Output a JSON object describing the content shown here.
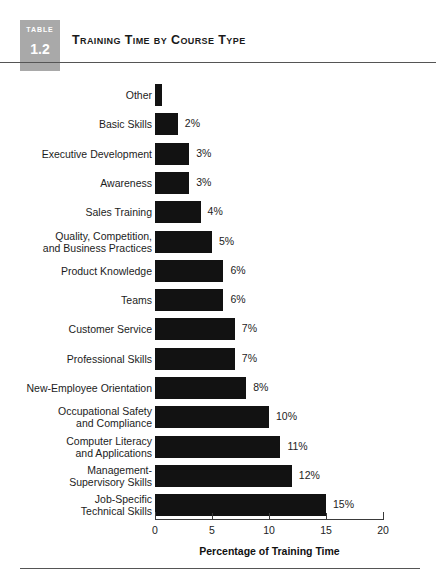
{
  "header": {
    "badge_word": "TABLE",
    "badge_number": "1.2",
    "title": "Training Time by Course Type",
    "badge_color": "#a9a9a9"
  },
  "chart_data": {
    "type": "bar",
    "orientation": "horizontal",
    "title": "Training Time by Course Type",
    "xlabel": "Percentage of Training Time",
    "ylabel": "",
    "xlim": [
      0,
      20
    ],
    "xticks": [
      "0",
      "5",
      "10",
      "15",
      "20"
    ],
    "grid": false,
    "legend": null,
    "bar_color": "#121212",
    "categories": [
      "Other",
      "Basic Skills",
      "Executive Development",
      "Awareness",
      "Sales Training",
      "Quality, Competition,\nand Business Practices",
      "Product Knowledge",
      "Teams",
      "Customer Service",
      "Professional Skills",
      "New-Employee Orientation",
      "Occupational Safety\nand Compliance",
      "Computer Literacy\nand Applications",
      "Management-\nSupervisory Skills",
      "Job-Specific\nTechnical Skills"
    ],
    "values": [
      0.6,
      2,
      3,
      3,
      4,
      5,
      6,
      6,
      7,
      7,
      8,
      10,
      11,
      12,
      15
    ],
    "value_labels": [
      "",
      "2%",
      "3%",
      "3%",
      "4%",
      "5%",
      "6%",
      "6%",
      "7%",
      "7%",
      "8%",
      "10%",
      "11%",
      "12%",
      "15%"
    ]
  }
}
